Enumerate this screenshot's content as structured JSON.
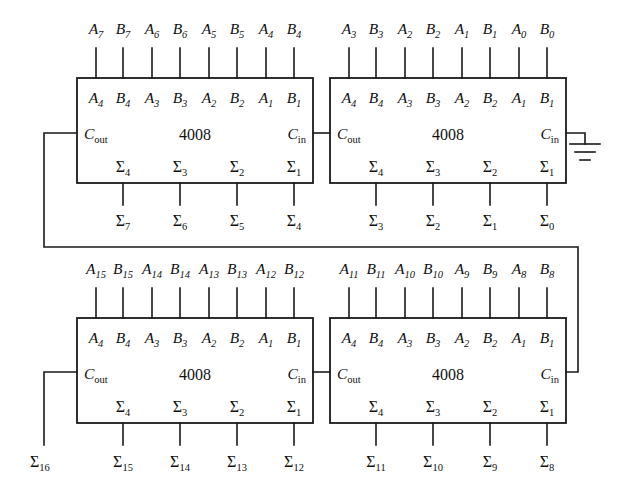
{
  "diagram": {
    "chip_part_number": "4008",
    "pin_labels_top": [
      "A4",
      "B4",
      "A3",
      "B3",
      "A2",
      "B2",
      "A1",
      "B1"
    ],
    "pin_labels_bottom": [
      "Σ4",
      "Σ3",
      "Σ2",
      "Σ1"
    ],
    "carry_out_label": "C",
    "carry_out_sub": "out",
    "carry_in_label": "C",
    "carry_in_sub": "in",
    "ground_icon": "ground-symbol"
  },
  "chips": [
    {
      "id": "chip-top-left",
      "name": "4008",
      "position": "top-left",
      "inputs": [
        "A7",
        "B7",
        "A6",
        "B6",
        "A5",
        "B5",
        "A4",
        "B4"
      ],
      "input_subs": [
        "7",
        "7",
        "6",
        "6",
        "5",
        "5",
        "4",
        "4"
      ],
      "pins_top": [
        "A4",
        "B4",
        "A3",
        "B3",
        "A2",
        "B2",
        "A1",
        "B1"
      ],
      "pins_bottom": [
        "Σ4",
        "Σ3",
        "Σ2",
        "Σ1"
      ],
      "outputs": [
        "Σ7",
        "Σ6",
        "Σ5",
        "Σ4"
      ],
      "output_subs": [
        "7",
        "6",
        "5",
        "4"
      ],
      "carry_out": "Cout",
      "carry_in": "Cin"
    },
    {
      "id": "chip-top-right",
      "name": "4008",
      "position": "top-right",
      "inputs": [
        "A3",
        "B3",
        "A2",
        "B2",
        "A1",
        "B1",
        "A0",
        "B0"
      ],
      "input_subs": [
        "3",
        "3",
        "2",
        "2",
        "1",
        "1",
        "0",
        "0"
      ],
      "pins_top": [
        "A4",
        "B4",
        "A3",
        "B3",
        "A2",
        "B2",
        "A1",
        "B1"
      ],
      "pins_bottom": [
        "Σ4",
        "Σ3",
        "Σ2",
        "Σ1"
      ],
      "outputs": [
        "Σ3",
        "Σ2",
        "Σ1",
        "Σ0"
      ],
      "output_subs": [
        "3",
        "2",
        "1",
        "0"
      ],
      "carry_out": "Cout",
      "carry_in": "Cin"
    },
    {
      "id": "chip-bottom-left",
      "name": "4008",
      "position": "bottom-left",
      "inputs": [
        "A15",
        "B15",
        "A14",
        "B14",
        "A13",
        "B13",
        "A12",
        "B12"
      ],
      "input_subs": [
        "15",
        "15",
        "14",
        "14",
        "13",
        "13",
        "12",
        "12"
      ],
      "pins_top": [
        "A4",
        "B4",
        "A3",
        "B3",
        "A2",
        "B2",
        "A1",
        "B1"
      ],
      "pins_bottom": [
        "Σ4",
        "Σ3",
        "Σ2",
        "Σ1"
      ],
      "outputs": [
        "Σ15",
        "Σ14",
        "Σ13",
        "Σ12"
      ],
      "output_subs": [
        "15",
        "14",
        "13",
        "12"
      ],
      "carry_out": "Cout",
      "carry_in": "Cin"
    },
    {
      "id": "chip-bottom-right",
      "name": "4008",
      "position": "bottom-right",
      "inputs": [
        "A11",
        "B11",
        "A10",
        "B10",
        "A9",
        "B9",
        "A8",
        "B8"
      ],
      "input_subs": [
        "11",
        "11",
        "10",
        "10",
        "9",
        "9",
        "8",
        "8"
      ],
      "pins_top": [
        "A4",
        "B4",
        "A3",
        "B3",
        "A2",
        "B2",
        "A1",
        "B1"
      ],
      "pins_bottom": [
        "Σ4",
        "Σ3",
        "Σ2",
        "Σ1"
      ],
      "outputs": [
        "Σ11",
        "Σ10",
        "Σ9",
        "Σ8"
      ],
      "output_subs": [
        "11",
        "10",
        "9",
        "8"
      ],
      "carry_out": "Cout",
      "carry_in": "Cin"
    }
  ],
  "msb_output": {
    "label": "Σ",
    "sub": "16"
  },
  "input_letters": {
    "tl": [
      "A",
      "B",
      "A",
      "B",
      "A",
      "B",
      "A",
      "B"
    ],
    "tr": [
      "A",
      "B",
      "A",
      "B",
      "A",
      "B",
      "A",
      "B"
    ],
    "bl": [
      "A",
      "B",
      "A",
      "B",
      "A",
      "B",
      "A",
      "B"
    ],
    "br": [
      "A",
      "B",
      "A",
      "B",
      "A",
      "B",
      "A",
      "B"
    ]
  },
  "colors": {
    "line": "#1a1a1a",
    "text": "#111111",
    "background": "#ffffff"
  }
}
